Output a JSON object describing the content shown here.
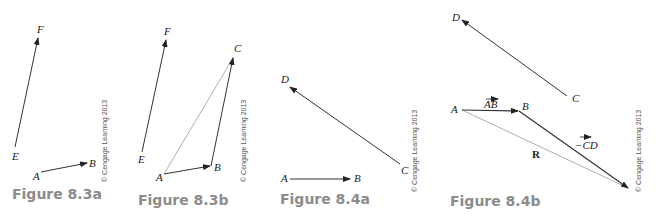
{
  "figures": [
    {
      "caption": "Figure 8.3a",
      "copyright": "© Cengage Learning 2013",
      "points": {
        "E": "E",
        "F": "F",
        "A": "A",
        "B": "B"
      }
    },
    {
      "caption": "Figure 8.3b",
      "copyright": "© Cengage Learning 2013",
      "points": {
        "E": "E",
        "F": "F",
        "A": "A",
        "B": "B",
        "C": "C"
      }
    },
    {
      "caption": "Figure 8.4a",
      "copyright": "© Cengage Learning 2013",
      "points": {
        "D": "D",
        "C": "C",
        "A": "A",
        "B": "B"
      }
    },
    {
      "caption": "Figure 8.4b",
      "copyright": "© Cengage Learning 2013",
      "points": {
        "D": "D",
        "C": "C",
        "A": "A",
        "B": "B"
      },
      "labels": {
        "ab": "AB",
        "neg_cd": "−CD",
        "resultant": "R"
      }
    }
  ],
  "colors": {
    "line": "#333333",
    "resultant": "#9a9a9a",
    "caption": "#8c8c8c"
  }
}
